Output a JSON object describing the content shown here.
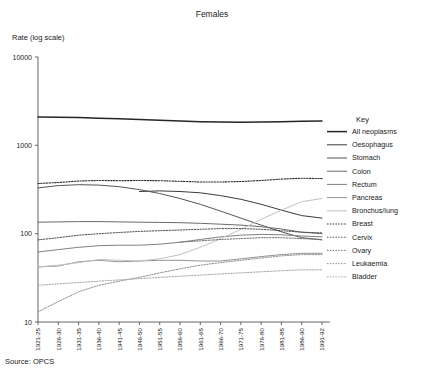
{
  "figure": {
    "title": "Females",
    "ylabel": "Rate (log scale)",
    "source": "Source:  OPCS",
    "legend_title": "Key"
  },
  "chart_data": {
    "type": "line",
    "title": "Females",
    "xlabel": "",
    "ylabel": "Rate (log scale)",
    "yscale": "log",
    "ylim": [
      10,
      10000
    ],
    "ytick_labels": [
      "10000",
      "1000",
      "100",
      "10"
    ],
    "yticks": [
      10000,
      1000,
      100,
      10
    ],
    "grid": false,
    "legend_position": "right",
    "legend_title": "Key",
    "categories": [
      "1921-25",
      "1926-30",
      "1931-35",
      "1936-40",
      "1941-45",
      "1946-50",
      "1951-55",
      "1956-60",
      "1961-65",
      "1966-70",
      "1971-75",
      "1976-80",
      "1981-85",
      "1986-90",
      "1991-92"
    ],
    "series": [
      {
        "name": "All neoplasms",
        "style": "solid",
        "color": "#262626",
        "width": 1.5,
        "values": [
          2100,
          2080,
          2060,
          2030,
          2000,
          1960,
          1920,
          1880,
          1850,
          1840,
          1830,
          1840,
          1850,
          1870,
          1880
        ]
      },
      {
        "name": "Oesophagus",
        "style": "solid",
        "color": "#3a3a3a",
        "width": 1.0,
        "values": [
          null,
          null,
          null,
          null,
          null,
          300,
          305,
          300,
          290,
          270,
          245,
          215,
          185,
          160,
          150
        ]
      },
      {
        "name": "Stomach",
        "style": "solid",
        "color": "#555555",
        "width": 1.0,
        "values": [
          330,
          350,
          358,
          355,
          340,
          315,
          285,
          250,
          215,
          180,
          150,
          125,
          105,
          90,
          85
        ]
      },
      {
        "name": "Colon",
        "style": "solid",
        "color": "#6b6b6b",
        "width": 1.0,
        "values": [
          135,
          136,
          137,
          137,
          136,
          135,
          134,
          133,
          131,
          128,
          125,
          120,
          113,
          104,
          100
        ]
      },
      {
        "name": "Rectum",
        "style": "solid",
        "color": "#808080",
        "width": 1.0,
        "values": [
          62,
          66,
          70,
          73,
          74,
          74,
          76,
          80,
          86,
          92,
          96,
          98,
          97,
          94,
          92
        ]
      },
      {
        "name": "Pancreas",
        "style": "solid",
        "color": "#949494",
        "width": 1.0,
        "values": [
          42,
          43,
          48,
          50,
          48,
          49,
          50,
          50,
          49,
          49,
          52,
          55,
          58,
          60,
          60
        ]
      },
      {
        "name": "Bronchus/lung",
        "style": "solid",
        "color": "#c2c2c2",
        "width": 1.0,
        "values": [
          42,
          44,
          47,
          51,
          50,
          49,
          52,
          58,
          70,
          88,
          112,
          145,
          185,
          230,
          250
        ]
      },
      {
        "name": "Breast",
        "style": "dotted",
        "color": "#2e2e2e",
        "width": 1.1,
        "values": [
          370,
          380,
          395,
          400,
          398,
          400,
          398,
          392,
          385,
          385,
          390,
          400,
          415,
          425,
          420
        ]
      },
      {
        "name": "Cervix",
        "style": "dotted",
        "color": "#4d4d4d",
        "width": 1.0,
        "values": [
          85,
          90,
          96,
          100,
          103,
          106,
          108,
          110,
          112,
          114,
          114,
          112,
          108,
          104,
          102
        ]
      },
      {
        "name": "Ovary",
        "style": "dotted",
        "color": "#6e6e6e",
        "width": 1.0,
        "values": [
          null,
          null,
          null,
          null,
          null,
          null,
          null,
          80,
          83,
          86,
          88,
          90,
          90,
          88,
          86
        ]
      },
      {
        "name": "Leukaemia",
        "style": "dotted",
        "color": "#8e8e8e",
        "width": 1.0,
        "values": [
          13,
          17,
          22,
          26,
          29,
          32,
          36,
          40,
          44,
          47,
          50,
          53,
          56,
          58,
          58
        ]
      },
      {
        "name": "Bladder",
        "style": "dotted",
        "color": "#a8a8a8",
        "width": 1.0,
        "values": [
          26,
          27,
          28,
          29,
          30,
          31,
          32,
          33,
          34,
          35,
          36,
          37,
          38,
          39,
          39
        ]
      }
    ]
  }
}
